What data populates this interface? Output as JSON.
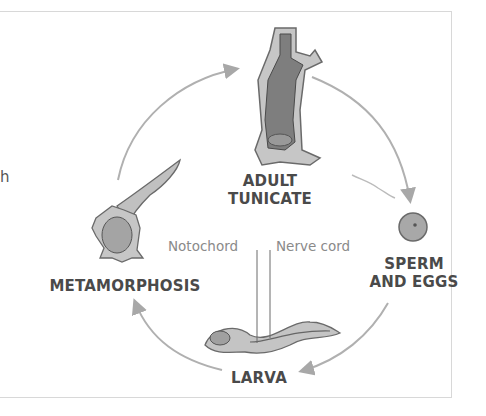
{
  "diagram": {
    "type": "life-cycle",
    "stages": [
      {
        "id": "adult",
        "label_line1": "ADULT",
        "label_line2": "TUNICATE"
      },
      {
        "id": "gametes",
        "label_line1": "SPERM",
        "label_line2": "AND EGGS"
      },
      {
        "id": "larva",
        "label": "LARVA"
      },
      {
        "id": "metamorphosis",
        "label": "METAMORPHOSIS"
      }
    ],
    "annotations": {
      "notochord": "Notochord",
      "nerve_cord": "Nerve cord"
    },
    "clipped_text": "h",
    "colors": {
      "arrow": "#b0b0b0",
      "body_dark": "#7a7a7a",
      "body_light": "#c4c4c4",
      "text": "#4a4a4a",
      "annotation": "#8a8a8a"
    }
  }
}
